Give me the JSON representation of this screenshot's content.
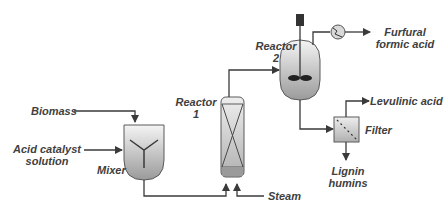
{
  "diagram": {
    "inputs": {
      "biomass": "Biomass",
      "acid_catalyst": [
        "Acid catalyst",
        "solution"
      ],
      "steam": "Steam"
    },
    "units": {
      "mixer": "Mixer",
      "reactor1": [
        "Reactor",
        "1"
      ],
      "reactor2": [
        "Reactor",
        "2"
      ],
      "filter": "Filter",
      "condenser": "condenser-icon"
    },
    "outputs": {
      "furfural": [
        "Furfural",
        "formic acid"
      ],
      "levulinic": "Levulinic acid",
      "lignin": [
        "Lignin",
        "humins"
      ]
    },
    "colors": {
      "line": "#3a3a3a",
      "vessel_top": "#f2f2f2",
      "vessel_bottom": "#9a9a9a",
      "label": "#404040"
    }
  }
}
